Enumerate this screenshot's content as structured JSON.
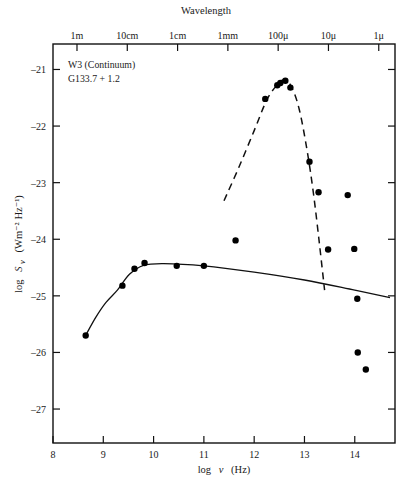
{
  "figure": {
    "top_axis_title": "Wavelength",
    "bottom_axis_title": "log ν (Hz)",
    "bottom_axis_title_parts": {
      "log": "log",
      "nu": "ν",
      "unit": "(Hz)"
    },
    "y_axis_title": "log Sν (Wm⁻² Hz⁻¹)",
    "y_axis_title_parts": {
      "log": "log",
      "s": "S",
      "nu": "ν",
      "unit": "(Wm⁻² Hz⁻¹)"
    },
    "annotations": [
      {
        "name": "source-name",
        "text": "W3 (Continuum)"
      },
      {
        "name": "source-designation",
        "text": "G133.7 + 1.2"
      }
    ],
    "frame_color": "#111111",
    "point_color": "#000000",
    "background": "#ffffff"
  },
  "chart_data": {
    "type": "scatter",
    "title": "Wavelength",
    "xlabel": "log ν (Hz)",
    "ylabel": "log Sν (Wm⁻² Hz⁻¹)",
    "xlim": [
      8.0,
      14.8
    ],
    "ylim": [
      -27.6,
      -20.55
    ],
    "grid": false,
    "legend": "none",
    "x_ticks": [
      8,
      9,
      10,
      11,
      12,
      13,
      14
    ],
    "x_tick_labels": [
      "8",
      "9",
      "10",
      "11",
      "12",
      "13",
      "14"
    ],
    "y_ticks": [
      -21,
      -22,
      -23,
      -24,
      -25,
      -26,
      -27
    ],
    "y_tick_labels": [
      "–21",
      "–22",
      "–23",
      "–24",
      "–25",
      "–26",
      "–27"
    ],
    "secondary_x_axis": {
      "label": "Wavelength",
      "ticks": [
        8.477,
        9.477,
        10.477,
        11.477,
        12.477,
        13.477,
        14.477
      ],
      "tick_labels": [
        "1m",
        "10cm",
        "1cm",
        "1mm",
        "100μ",
        "10μ",
        "1μ"
      ]
    },
    "series": [
      {
        "name": "radio-continuum-points",
        "marker": "filled-circle",
        "points": [
          {
            "x": 8.65,
            "y": -25.7
          },
          {
            "x": 9.38,
            "y": -24.82
          },
          {
            "x": 9.62,
            "y": -24.52
          },
          {
            "x": 9.82,
            "y": -24.42
          },
          {
            "x": 10.46,
            "y": -24.47
          },
          {
            "x": 11.0,
            "y": -24.47
          }
        ]
      },
      {
        "name": "infrared-peak-points",
        "marker": "filled-circle",
        "points": [
          {
            "x": 11.63,
            "y": -24.02
          },
          {
            "x": 12.22,
            "y": -21.52
          },
          {
            "x": 12.46,
            "y": -21.28
          },
          {
            "x": 12.52,
            "y": -21.24
          },
          {
            "x": 12.62,
            "y": -21.2
          },
          {
            "x": 12.72,
            "y": -21.32
          },
          {
            "x": 13.1,
            "y": -22.63
          },
          {
            "x": 13.28,
            "y": -23.17
          },
          {
            "x": 13.47,
            "y": -24.18
          },
          {
            "x": 13.86,
            "y": -23.22
          },
          {
            "x": 13.99,
            "y": -24.17
          },
          {
            "x": 14.05,
            "y": -25.05
          },
          {
            "x": 14.06,
            "y": -26.0
          },
          {
            "x": 14.22,
            "y": -26.3
          }
        ]
      }
    ],
    "fitted_curves": [
      {
        "name": "free-free-continuum-fit",
        "style": "solid",
        "points": [
          {
            "x": 8.66,
            "y": -25.68
          },
          {
            "x": 8.85,
            "y": -25.38
          },
          {
            "x": 9.05,
            "y": -25.12
          },
          {
            "x": 9.28,
            "y": -24.9
          },
          {
            "x": 9.52,
            "y": -24.62
          },
          {
            "x": 9.8,
            "y": -24.46
          },
          {
            "x": 10.2,
            "y": -24.43
          },
          {
            "x": 11.0,
            "y": -24.47
          },
          {
            "x": 12.0,
            "y": -24.58
          },
          {
            "x": 13.0,
            "y": -24.72
          },
          {
            "x": 14.0,
            "y": -24.9
          },
          {
            "x": 14.7,
            "y": -25.03
          }
        ]
      },
      {
        "name": "dust-emission-fit",
        "style": "dashed",
        "points": [
          {
            "x": 11.4,
            "y": -23.32
          },
          {
            "x": 11.7,
            "y": -22.72
          },
          {
            "x": 12.0,
            "y": -22.08
          },
          {
            "x": 12.25,
            "y": -21.54
          },
          {
            "x": 12.45,
            "y": -21.28
          },
          {
            "x": 12.6,
            "y": -21.18
          },
          {
            "x": 12.75,
            "y": -21.32
          },
          {
            "x": 12.9,
            "y": -21.72
          },
          {
            "x": 13.05,
            "y": -22.42
          },
          {
            "x": 13.18,
            "y": -23.2
          },
          {
            "x": 13.3,
            "y": -24.1
          },
          {
            "x": 13.4,
            "y": -24.9
          }
        ]
      }
    ]
  }
}
